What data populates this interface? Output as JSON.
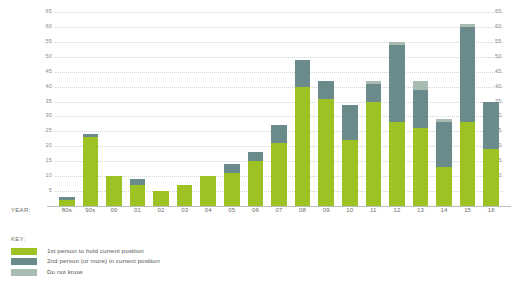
{
  "axis": {
    "year_tag": "YEAR:",
    "yticks": [
      65,
      60,
      55,
      50,
      45,
      40,
      35,
      30,
      25,
      20,
      15,
      10,
      5
    ]
  },
  "legend": {
    "title": "KEY:",
    "entries": [
      {
        "label": "1st person to hold current position",
        "color": "#9cc223"
      },
      {
        "label": "2nd person (or more) in current position",
        "color": "#6b8a8c"
      },
      {
        "label": "Do not know",
        "color": "#a9bcb2"
      }
    ]
  },
  "colors": {
    "first_person": "#9cc223",
    "second_person": "#6b8a8c",
    "do_not_know": "#a9bcb2",
    "gridline": "#cfd6d9",
    "baseline": "#b9bfc2",
    "text": "#6d6d6d",
    "background": "#ffffff"
  },
  "chart_data": {
    "type": "bar",
    "title": "",
    "subtitle": "",
    "xlabel": "YEAR:",
    "ylabel": "",
    "ylim": [
      0,
      65
    ],
    "ytick_step": 5,
    "grid": true,
    "stacked": true,
    "legend_position": "bottom-left",
    "categories": [
      "80s",
      "90s",
      "00",
      "01",
      "02",
      "03",
      "04",
      "05",
      "06",
      "07",
      "08",
      "09",
      "10",
      "11",
      "12",
      "13",
      "14",
      "15",
      "16"
    ],
    "series": [
      {
        "name": "1st person to hold current position",
        "color": "#9cc223",
        "values": [
          2,
          23,
          10,
          7,
          5,
          7,
          10,
          11,
          15,
          21,
          40,
          36,
          22,
          35,
          28,
          26,
          13,
          28,
          19
        ]
      },
      {
        "name": "2nd person (or more) in current position",
        "color": "#6b8a8c",
        "values": [
          1,
          1,
          0,
          2,
          0,
          0,
          0,
          3,
          3,
          6,
          9,
          6,
          12,
          6,
          26,
          13,
          15,
          32,
          16
        ]
      },
      {
        "name": "Do not know",
        "color": "#a9bcb2",
        "values": [
          0,
          0,
          0,
          0,
          0,
          0,
          0,
          0,
          0,
          0,
          0,
          0,
          0,
          1,
          1,
          3,
          1,
          1,
          0
        ]
      }
    ],
    "totals": [
      3,
      24,
      10,
      9,
      5,
      7,
      10,
      14,
      18,
      27,
      49,
      42,
      34,
      42,
      55,
      42,
      29,
      61,
      35
    ]
  }
}
